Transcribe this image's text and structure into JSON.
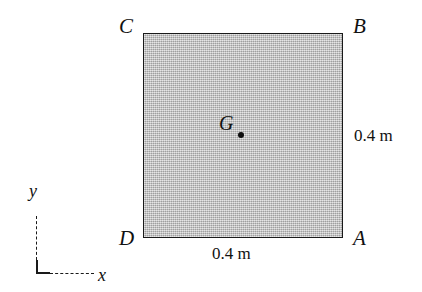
{
  "figure": {
    "type": "engineering-mechanics-diagram",
    "background_color": "#ffffff",
    "line_color": "#1a1a1a"
  },
  "plate": {
    "shape": "square",
    "fill_color": "#b9b9b9",
    "border_color": "#1a1a1a",
    "corners": [
      {
        "id": "corner-C",
        "label": "C",
        "position": "top-left"
      },
      {
        "id": "corner-B",
        "label": "B",
        "position": "top-right"
      },
      {
        "id": "corner-D",
        "label": "D",
        "position": "bottom-left"
      },
      {
        "id": "corner-A",
        "label": "A",
        "position": "bottom-right"
      }
    ]
  },
  "centroid": {
    "label": "G",
    "marker": "filled-dot",
    "marker_color": "#0d0d0d"
  },
  "dimensions": {
    "right_side": "0.4 m",
    "bottom_side": "0.4 m"
  },
  "axes": {
    "y_label": "y",
    "x_label": "x",
    "style": "dashed-L-indicator"
  }
}
